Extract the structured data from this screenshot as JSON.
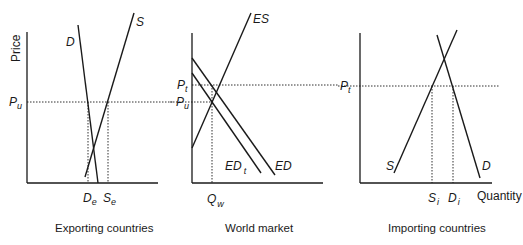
{
  "panels": [
    {
      "caption": "Exporting countries",
      "y_axis_label": "Price",
      "price_label": "P",
      "price_sub": "u",
      "curves": {
        "demand": "D",
        "supply": "S"
      },
      "quantities": [
        {
          "main": "D",
          "sub": "e"
        },
        {
          "main": "S",
          "sub": "e"
        }
      ]
    },
    {
      "caption": "World market",
      "price_labels": [
        {
          "main": "P",
          "sub": "t"
        },
        {
          "main": "P",
          "sub": "u"
        }
      ],
      "right_price_label": {
        "main": "P",
        "sub": "t"
      },
      "curves": {
        "excess_supply": "ES",
        "excess_demand": "ED",
        "excess_demand_tariff": {
          "main": "ED",
          "sub": "t"
        }
      },
      "quantities": [
        {
          "main": "Q",
          "sub": "w"
        }
      ]
    },
    {
      "caption": "Importing countries",
      "x_axis_label": "Quantity",
      "curves": {
        "demand": "D",
        "supply": "S"
      },
      "quantities": [
        {
          "main": "S",
          "sub": "i"
        },
        {
          "main": "D",
          "sub": "i"
        }
      ]
    }
  ]
}
